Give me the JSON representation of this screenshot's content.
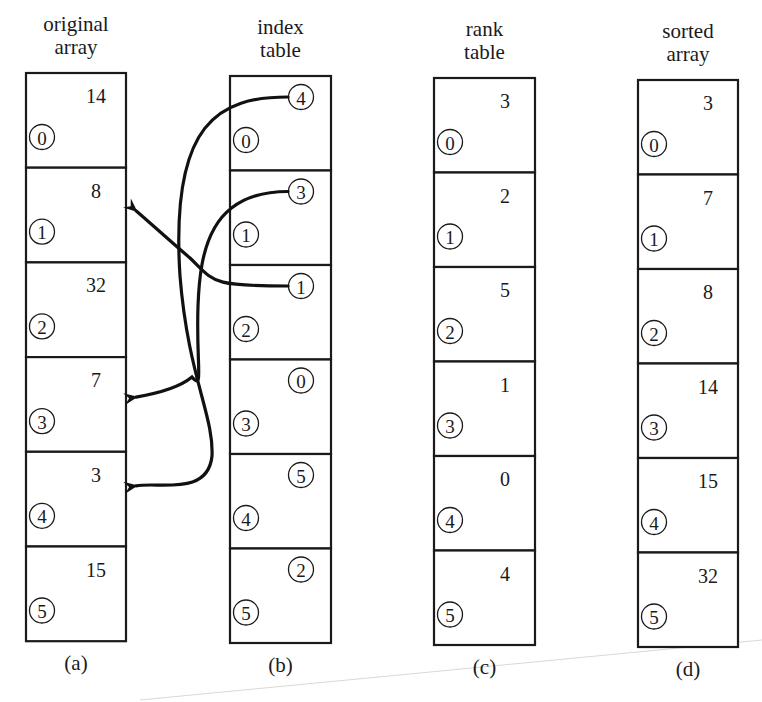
{
  "figure": {
    "kind": "indexing-and-ranking-illustration",
    "panels": [
      {
        "id": "a",
        "title_lines": [
          "original",
          "array"
        ],
        "caption": "(a)",
        "cell_style": "plain-value",
        "cells": [
          {
            "index": "0",
            "value": "14"
          },
          {
            "index": "1",
            "value": "8"
          },
          {
            "index": "2",
            "value": "32"
          },
          {
            "index": "3",
            "value": "7"
          },
          {
            "index": "4",
            "value": "3"
          },
          {
            "index": "5",
            "value": "15"
          }
        ]
      },
      {
        "id": "b",
        "title_lines": [
          "index",
          "table"
        ],
        "caption": "(b)",
        "cell_style": "circled-value",
        "cells": [
          {
            "index": "0",
            "value": "4"
          },
          {
            "index": "1",
            "value": "3"
          },
          {
            "index": "2",
            "value": "1"
          },
          {
            "index": "3",
            "value": "0"
          },
          {
            "index": "4",
            "value": "5"
          },
          {
            "index": "5",
            "value": "2"
          }
        ]
      },
      {
        "id": "c",
        "title_lines": [
          "rank",
          "table"
        ],
        "caption": "(c)",
        "cell_style": "plain-value",
        "cells": [
          {
            "index": "0",
            "value": "3"
          },
          {
            "index": "1",
            "value": "2"
          },
          {
            "index": "2",
            "value": "5"
          },
          {
            "index": "3",
            "value": "1"
          },
          {
            "index": "4",
            "value": "0"
          },
          {
            "index": "5",
            "value": "4"
          }
        ]
      },
      {
        "id": "d",
        "title_lines": [
          "sorted",
          "array"
        ],
        "caption": "(d)",
        "cell_style": "plain-value",
        "cells": [
          {
            "index": "0",
            "value": "3"
          },
          {
            "index": "1",
            "value": "7"
          },
          {
            "index": "2",
            "value": "8"
          },
          {
            "index": "3",
            "value": "14"
          },
          {
            "index": "4",
            "value": "15"
          },
          {
            "index": "5",
            "value": "32"
          }
        ]
      }
    ],
    "arrows": [
      {
        "from_panel": "b",
        "from_row": 0,
        "to_panel": "a",
        "to_row": 4,
        "description": "index table entry 4 points to original array element 4"
      },
      {
        "from_panel": "b",
        "from_row": 1,
        "to_panel": "a",
        "to_row": 3,
        "description": "index table entry 3 points to original array element 3"
      },
      {
        "from_panel": "b",
        "from_row": 2,
        "to_panel": "a",
        "to_row": 1,
        "description": "index table entry 1 points to original array element 1"
      }
    ]
  }
}
